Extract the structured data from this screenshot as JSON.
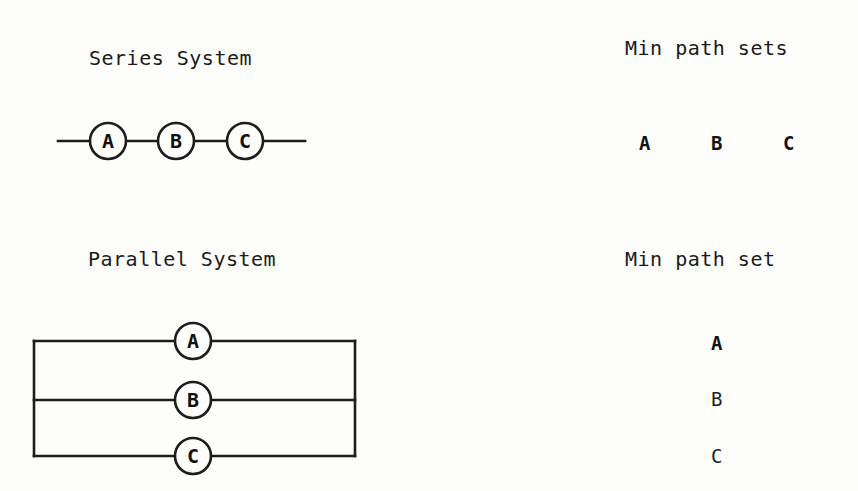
{
  "page": {
    "background_color": "#fdfdfb",
    "ink_color": "#1d1d1d",
    "width": 858,
    "height": 491
  },
  "series_section": {
    "title": "Series System",
    "title_x": 89,
    "title_y": 48,
    "nodes": [
      {
        "label": "A",
        "cx": 108,
        "cy": 141,
        "r": 18
      },
      {
        "label": "B",
        "cx": 176,
        "cy": 141,
        "r": 18
      },
      {
        "label": "C",
        "cx": 245,
        "cy": 141,
        "r": 18
      }
    ],
    "lead_left_x1": 58,
    "lead_right_x2": 305,
    "wire_y": 141
  },
  "parallel_section": {
    "title": "Parallel System",
    "title_x": 88,
    "title_y": 249,
    "rect_left": 34,
    "rect_right": 355,
    "rect_top": 341,
    "rect_bottom": 456,
    "middle_y": 400,
    "nodes": [
      {
        "label": "A",
        "cx": 193,
        "cy": 341,
        "r": 18
      },
      {
        "label": "B",
        "cx": 193,
        "cy": 400,
        "r": 18
      },
      {
        "label": "C",
        "cx": 193,
        "cy": 456,
        "r": 18
      }
    ]
  },
  "series_paths": {
    "title": "Min path sets",
    "title_x": 625,
    "title_y": 38,
    "orientation": "horizontal",
    "row_y": 134,
    "items": [
      {
        "label": "A",
        "x": 639
      },
      {
        "label": "B",
        "x": 711
      },
      {
        "label": "C",
        "x": 783
      }
    ]
  },
  "parallel_paths": {
    "title": "Min path set",
    "title_x": 625,
    "title_y": 249,
    "orientation": "vertical",
    "column_x": 711,
    "items": [
      {
        "label": "A",
        "y": 334
      },
      {
        "label": "B",
        "y": 390
      },
      {
        "label": "C",
        "y": 447
      }
    ]
  }
}
